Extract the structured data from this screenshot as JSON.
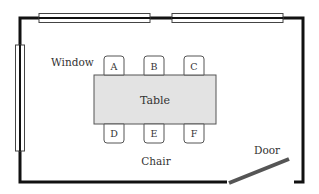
{
  "diagram": {
    "colors": {
      "wall": "#111111",
      "window_fill": "#ffffff",
      "window_stroke": "#444444",
      "table_fill": "#e3e3e3",
      "table_stroke": "#555555",
      "chair_fill": "#ffffff",
      "chair_stroke": "#555555",
      "door": "#555555",
      "text": "#333333"
    },
    "labels": {
      "window": "Window",
      "table": "Table",
      "chair": "Chair",
      "door": "Door"
    },
    "chairs": [
      {
        "id": "A",
        "label": "A",
        "side": "top"
      },
      {
        "id": "B",
        "label": "B",
        "side": "top"
      },
      {
        "id": "C",
        "label": "C",
        "side": "top"
      },
      {
        "id": "D",
        "label": "D",
        "side": "bottom"
      },
      {
        "id": "E",
        "label": "E",
        "side": "bottom"
      },
      {
        "id": "F",
        "label": "F",
        "side": "bottom"
      }
    ],
    "windows": [
      {
        "id": "top-left-window",
        "wall": "top"
      },
      {
        "id": "top-right-window",
        "wall": "top"
      },
      {
        "id": "left-window",
        "wall": "left"
      }
    ]
  }
}
